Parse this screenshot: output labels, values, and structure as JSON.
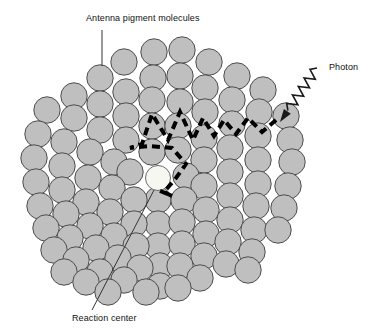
{
  "figure": {
    "background_color": "#ffffff"
  },
  "labels": {
    "antenna": "Antenna pigment molecules",
    "photon": "Photon",
    "reaction_center": "Reaction center"
  },
  "colors": {
    "pigment_fill": "#bfbfbf",
    "pigment_stroke": "#4d4d4d",
    "reaction_center_fill": "#f7f7f2",
    "reaction_center_stroke": "#6b6b6b",
    "energy_path": "#000000",
    "photon_ray": "#1a1a1a",
    "leader_line": "#333333",
    "text": "#111111"
  },
  "diagram": {
    "type": "schematic",
    "pigment_count": 95,
    "pigment_radius": 13.2,
    "reaction_center": {
      "cx": 158,
      "cy": 178,
      "r": 12.5
    },
    "pigments": [
      [
        154,
        52
      ],
      [
        182,
        50
      ],
      [
        124,
        62
      ],
      [
        209,
        62
      ],
      [
        100,
        78
      ],
      [
        153,
        78
      ],
      [
        180,
        76
      ],
      [
        237,
        76
      ],
      [
        263,
        90
      ],
      [
        74,
        96
      ],
      [
        126,
        92
      ],
      [
        205,
        88
      ],
      [
        47,
        110
      ],
      [
        100,
        104
      ],
      [
        152,
        100
      ],
      [
        180,
        102
      ],
      [
        232,
        100
      ],
      [
        259,
        112
      ],
      [
        286,
        116
      ],
      [
        74,
        118
      ],
      [
        126,
        116
      ],
      [
        205,
        112
      ],
      [
        38,
        134
      ],
      [
        100,
        130
      ],
      [
        152,
        126
      ],
      [
        178,
        126
      ],
      [
        232,
        124
      ],
      [
        258,
        136
      ],
      [
        290,
        140
      ],
      [
        64,
        142
      ],
      [
        126,
        140
      ],
      [
        204,
        138
      ],
      [
        34,
        158
      ],
      [
        90,
        152
      ],
      [
        152,
        152
      ],
      [
        178,
        150
      ],
      [
        230,
        148
      ],
      [
        258,
        160
      ],
      [
        292,
        162
      ],
      [
        62,
        166
      ],
      [
        114,
        162
      ],
      [
        204,
        160
      ],
      [
        130,
        172
      ],
      [
        36,
        182
      ],
      [
        88,
        178
      ],
      [
        186,
        176
      ],
      [
        230,
        172
      ],
      [
        258,
        184
      ],
      [
        288,
        186
      ],
      [
        62,
        190
      ],
      [
        112,
        188
      ],
      [
        158,
        200
      ],
      [
        204,
        186
      ],
      [
        184,
        200
      ],
      [
        40,
        206
      ],
      [
        86,
        202
      ],
      [
        134,
        200
      ],
      [
        230,
        196
      ],
      [
        256,
        206
      ],
      [
        284,
        208
      ],
      [
        66,
        214
      ],
      [
        110,
        212
      ],
      [
        158,
        224
      ],
      [
        206,
        210
      ],
      [
        182,
        222
      ],
      [
        46,
        228
      ],
      [
        90,
        226
      ],
      [
        134,
        224
      ],
      [
        230,
        220
      ],
      [
        254,
        230
      ],
      [
        278,
        230
      ],
      [
        70,
        238
      ],
      [
        114,
        236
      ],
      [
        158,
        246
      ],
      [
        206,
        234
      ],
      [
        182,
        244
      ],
      [
        54,
        250
      ],
      [
        96,
        248
      ],
      [
        136,
        246
      ],
      [
        228,
        242
      ],
      [
        252,
        252
      ],
      [
        76,
        260
      ],
      [
        118,
        258
      ],
      [
        160,
        266
      ],
      [
        204,
        256
      ],
      [
        180,
        266
      ],
      [
        64,
        272
      ],
      [
        100,
        272
      ],
      [
        140,
        268
      ],
      [
        226,
        264
      ],
      [
        248,
        270
      ],
      [
        86,
        282
      ],
      [
        124,
        280
      ],
      [
        160,
        286
      ],
      [
        200,
        278
      ],
      [
        178,
        288
      ],
      [
        108,
        292
      ],
      [
        146,
        292
      ]
    ],
    "energy_transfer_path": {
      "style": "dashed",
      "stroke_width": 4,
      "dash": "8 5",
      "points": [
        [
          276,
          120
        ],
        [
          262,
          132
        ],
        [
          248,
          118
        ],
        [
          236,
          134
        ],
        [
          224,
          120
        ],
        [
          214,
          136
        ],
        [
          203,
          118
        ],
        [
          193,
          140
        ],
        [
          180,
          112
        ],
        [
          168,
          140
        ],
        [
          152,
          114
        ],
        [
          142,
          144
        ],
        [
          130,
          148
        ],
        [
          150,
          146
        ],
        [
          172,
          148
        ],
        [
          186,
          164
        ],
        [
          176,
          178
        ],
        [
          164,
          192
        ],
        [
          172,
          196
        ],
        [
          158,
          190
        ]
      ]
    },
    "photon_ray": {
      "style": "sawtooth-wave-with-arrow",
      "start": [
        317,
        68
      ],
      "end": [
        280,
        122
      ],
      "arrow_direction": "down-left",
      "zigzag_amplitude": 5,
      "cycles": 5
    },
    "leader_lines": [
      {
        "name": "antenna",
        "from": [
          102,
          30
        ],
        "to": [
          102,
          66
        ]
      },
      {
        "name": "reaction-center",
        "from": [
          154,
          190
        ],
        "to": [
          92,
          310
        ]
      }
    ]
  }
}
